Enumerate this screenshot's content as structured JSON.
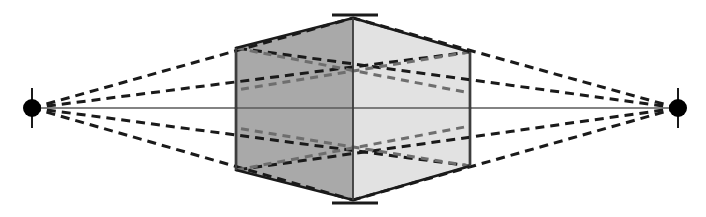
{
  "canvas": {
    "title": "Two-Point Perspective Cube Diagram",
    "width": 706,
    "height": 217,
    "background_color": "#ffffff"
  },
  "colors": {
    "left_face_fill": "#a9a9a9",
    "right_face_fill": "#e2e2e2",
    "outline": "#1a1a1a",
    "hidden_edge": "#6e6e6e",
    "horizon_line": "#5a5a5a",
    "vanishing_point": "#000000",
    "tick_mark": "#1a1a1a"
  },
  "labels": {
    "left_vanishing_point": "left-vanishing-point",
    "right_vanishing_point": "right-vanishing-point",
    "horizon": "horizon-line",
    "box": "perspective-box",
    "left_face": "box-left-face",
    "right_face": "box-right-face",
    "center_edge": "box-center-vertical-edge",
    "top_apex": "box-top-apex",
    "bottom_apex": "box-bottom-apex"
  },
  "chart_data": {
    "type": "diagram",
    "xlabel": "",
    "ylabel": "",
    "xlim": [
      0,
      706
    ],
    "ylim": [
      0,
      217
    ],
    "grid": false,
    "legend": "none",
    "vanishing_points": [
      {
        "name": "VPL",
        "x": 32,
        "y": 108,
        "radius": 9,
        "tick_top": 88,
        "tick_bottom": 128
      },
      {
        "name": "VPR",
        "x": 678,
        "y": 108,
        "radius": 9,
        "tick_top": 88,
        "tick_bottom": 128
      }
    ],
    "horizon": {
      "y": 108,
      "x_start": 32,
      "x_end": 678
    },
    "box_vertices": {
      "top_apex": {
        "x": 353,
        "y": 18
      },
      "bottom_apex": {
        "x": 353,
        "y": 200
      },
      "left_top": {
        "x": 236,
        "y": 48
      },
      "left_bottom": {
        "x": 236,
        "y": 170
      },
      "right_top": {
        "x": 470,
        "y": 52
      },
      "right_bottom": {
        "x": 470,
        "y": 166
      },
      "center_top": {
        "x": 353,
        "y": 18
      },
      "center_bottom": {
        "x": 353,
        "y": 200
      }
    },
    "apex_ticks": [
      {
        "name": "top-apex-tick",
        "x_start": 332,
        "x_end": 378,
        "y": 15
      },
      {
        "name": "bottom-apex-tick",
        "x_start": 332,
        "x_end": 378,
        "y": 203
      }
    ],
    "convergence_lines_left": [
      {
        "from": [
          32,
          108
        ],
        "to": [
          353,
          18
        ]
      },
      {
        "from": [
          32,
          108
        ],
        "to": [
          470,
          52
        ]
      },
      {
        "from": [
          32,
          108
        ],
        "to": [
          470,
          166
        ]
      },
      {
        "from": [
          32,
          108
        ],
        "to": [
          353,
          200
        ]
      }
    ],
    "convergence_lines_right": [
      {
        "from": [
          678,
          108
        ],
        "to": [
          353,
          18
        ]
      },
      {
        "from": [
          678,
          108
        ],
        "to": [
          236,
          48
        ]
      },
      {
        "from": [
          678,
          108
        ],
        "to": [
          236,
          170
        ]
      },
      {
        "from": [
          678,
          108
        ],
        "to": [
          353,
          200
        ]
      }
    ],
    "hidden_edges": [
      {
        "name": "upper-back-edge-left",
        "from": [
          236,
          48
        ],
        "to": [
          470,
          93
        ]
      },
      {
        "name": "upper-back-edge-right",
        "from": [
          470,
          52
        ],
        "to": [
          236,
          90
        ]
      },
      {
        "name": "lower-back-edge-left",
        "from": [
          236,
          170
        ],
        "to": [
          470,
          126
        ]
      },
      {
        "name": "lower-back-edge-right",
        "from": [
          470,
          166
        ],
        "to": [
          236,
          128
        ]
      }
    ]
  }
}
